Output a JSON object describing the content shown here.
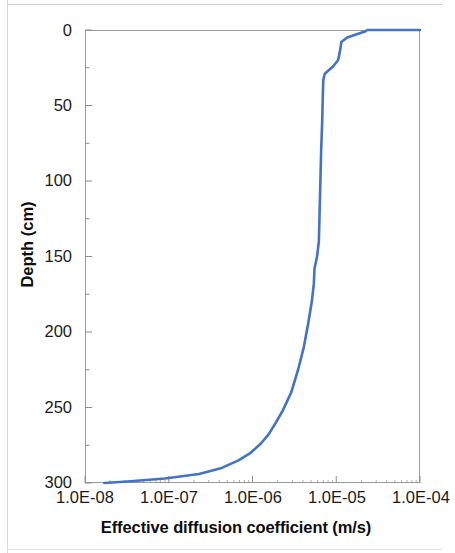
{
  "chart_data": {
    "type": "line",
    "title": "",
    "xlabel": "Effective diffusion coefficient (m/s)",
    "ylabel": "Depth (cm)",
    "xscale": "log",
    "xlim": [
      1e-08,
      0.0001
    ],
    "ylim": [
      0,
      300
    ],
    "y_inverted": true,
    "grid": false,
    "legend": null,
    "xtick_labels": [
      "1.0E-08",
      "1.0E-07",
      "1.0E-06",
      "1.0E-05",
      "1.0E-04"
    ],
    "xtick_values": [
      1e-08,
      1e-07,
      1e-06,
      1e-05,
      0.0001
    ],
    "ytick_labels": [
      "0",
      "50",
      "100",
      "150",
      "200",
      "250",
      "300"
    ],
    "ytick_values": [
      0,
      50,
      100,
      150,
      200,
      250,
      300
    ],
    "y_minor_tick_interval": 25,
    "series": [
      {
        "name": "Effective diffusion coefficient",
        "color": "#4472c4",
        "line_width": 2.6,
        "x_name": "diffusion_coefficient_m_per_s",
        "y_name": "depth_cm",
        "points": [
          [
            0.0001,
            0
          ],
          [
            2.35e-05,
            0
          ],
          [
            2.2e-05,
            1
          ],
          [
            1.35e-05,
            5
          ],
          [
            1.15e-05,
            8
          ],
          [
            1.1e-05,
            15
          ],
          [
            1.05e-05,
            20
          ],
          [
            9.2e-06,
            24
          ],
          [
            7.3e-06,
            29
          ],
          [
            7e-06,
            33
          ],
          [
            6.9e-06,
            45
          ],
          [
            6.8e-06,
            60
          ],
          [
            6.6e-06,
            80
          ],
          [
            6.5e-06,
            95
          ],
          [
            6.4e-06,
            110
          ],
          [
            6.3e-06,
            125
          ],
          [
            6.2e-06,
            140
          ],
          [
            5.9e-06,
            150
          ],
          [
            5.5e-06,
            158
          ],
          [
            5.4e-06,
            168
          ],
          [
            5.1e-06,
            180
          ],
          [
            4.6e-06,
            195
          ],
          [
            4.1e-06,
            210
          ],
          [
            3.5e-06,
            225
          ],
          [
            2.9e-06,
            240
          ],
          [
            2.3e-06,
            252
          ],
          [
            1.9e-06,
            260
          ],
          [
            1.55e-06,
            268
          ],
          [
            1.25e-06,
            274
          ],
          [
            9.5e-07,
            280
          ],
          [
            6.8e-07,
            285
          ],
          [
            4.3e-07,
            290
          ],
          [
            2.3e-07,
            294
          ],
          [
            9e-08,
            297
          ],
          [
            3.2e-08,
            299
          ],
          [
            1.7e-08,
            300
          ]
        ]
      }
    ]
  },
  "axes": {
    "x_title": "Effective diffusion coefficient (m/s)",
    "y_title": "Depth (cm)",
    "x_labels": [
      "1.0E-08",
      "1.0E-07",
      "1.0E-06",
      "1.0E-05",
      "1.0E-04"
    ],
    "y_labels": [
      "0",
      "50",
      "100",
      "150",
      "200",
      "250",
      "300"
    ]
  },
  "style": {
    "line_color": "#4472c4",
    "frame_color": "#9b9b9b",
    "tick_color": "#8c8c8c",
    "text_color": "#1b1b1b",
    "background": "#ffffff"
  }
}
